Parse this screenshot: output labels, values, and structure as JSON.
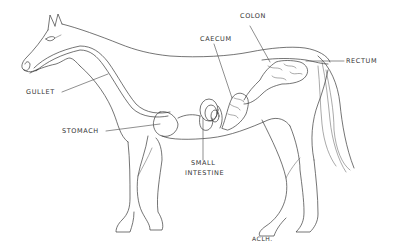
{
  "diagram": {
    "labels": {
      "gullet": "GULLET",
      "stomach": "STOMACH",
      "small_intestine_line1": "SMALL",
      "small_intestine_line2": "INTESTINE",
      "caecum": "CAECUM",
      "colon": "COLON",
      "rectum": "RECTUM"
    },
    "signature": "ACLH.",
    "colors": {
      "line": "#3a3a3a",
      "background": "#ffffff",
      "text": "#333333"
    }
  }
}
